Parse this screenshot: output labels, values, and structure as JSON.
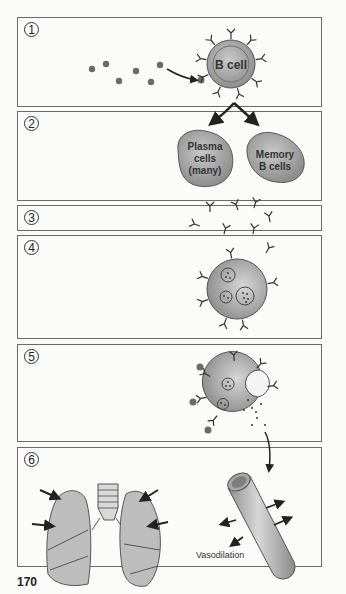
{
  "figure": {
    "page_number": "170",
    "panels": [
      {
        "step": "1",
        "label": "B cell",
        "description": "Antigen binds B cell receptor"
      },
      {
        "step": "2",
        "labels": [
          "Plasma",
          "cells",
          "(many)",
          "Memory",
          "B cells"
        ]
      },
      {
        "step": "3",
        "description": "Antibodies released"
      },
      {
        "step": "4",
        "description": "Antibodies bind mast cell"
      },
      {
        "step": "5",
        "description": "Antigen crosslinks, mast cell degranulates"
      },
      {
        "step": "6",
        "label": "Vasodilation",
        "description": "Lungs bronchoconstriction and blood vessel vasodilation"
      }
    ]
  },
  "colors": {
    "border": "#6a6a6a",
    "cell_fill": "#a8a8a8",
    "antigen": "#666666",
    "arrow": "#222222"
  }
}
